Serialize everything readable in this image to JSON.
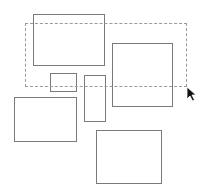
{
  "canvas": {
    "width": 200,
    "height": 191,
    "background": "#ffffff",
    "stroke_color": "#7a7a7a",
    "marquee_color": "#9a9a9a"
  },
  "shapes": [
    {
      "id": "rect-top-left",
      "x": 33,
      "y": 14,
      "w": 72,
      "h": 52
    },
    {
      "id": "rect-right",
      "x": 112,
      "y": 43,
      "w": 61,
      "h": 64
    },
    {
      "id": "rect-small",
      "x": 50,
      "y": 73,
      "w": 27,
      "h": 19
    },
    {
      "id": "rect-tall",
      "x": 84,
      "y": 75,
      "w": 22,
      "h": 47
    },
    {
      "id": "rect-bottom-left",
      "x": 14,
      "y": 97,
      "w": 63,
      "h": 45
    },
    {
      "id": "rect-bottom-right",
      "x": 96,
      "y": 130,
      "w": 66,
      "h": 54
    }
  ],
  "selection_marquee": {
    "x": 25,
    "y": 23,
    "w": 162,
    "h": 64
  },
  "cursor": {
    "icon": "arrow-pointer-icon",
    "x": 186,
    "y": 86
  }
}
